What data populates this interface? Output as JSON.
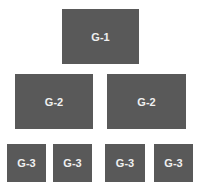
{
  "diagram": {
    "levels": [
      {
        "nodes": [
          {
            "label": "G-1"
          }
        ]
      },
      {
        "nodes": [
          {
            "label": "G-2"
          },
          {
            "label": "G-2"
          }
        ]
      },
      {
        "nodes": [
          {
            "label": "G-3"
          },
          {
            "label": "G-3"
          },
          {
            "label": "G-3"
          },
          {
            "label": "G-3"
          }
        ]
      }
    ],
    "colors": {
      "box": "#595959",
      "text": "#f0f0f0",
      "background": "#ffffff"
    }
  }
}
